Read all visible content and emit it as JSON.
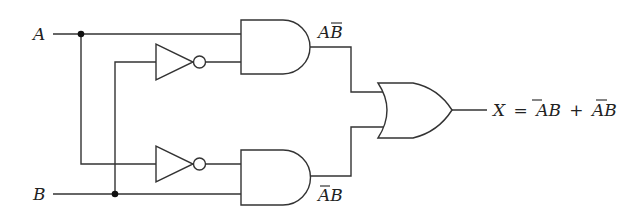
{
  "diagram": {
    "type": "logic-circuit",
    "inputs": {
      "a_label": "A",
      "b_label": "B"
    },
    "gates": [
      {
        "id": "not1",
        "kind": "NOT",
        "input": "B",
        "output": "B̄"
      },
      {
        "id": "not2",
        "kind": "NOT",
        "input": "A",
        "output": "Ā"
      },
      {
        "id": "and1",
        "kind": "AND",
        "inputs": [
          "A",
          "B̄"
        ],
        "output_label": "AB̄"
      },
      {
        "id": "and2",
        "kind": "AND",
        "inputs": [
          "Ā",
          "B"
        ],
        "output_label": "ĀB"
      },
      {
        "id": "or1",
        "kind": "OR",
        "inputs": [
          "AB̄",
          "ĀB"
        ],
        "output": "X"
      }
    ],
    "labels": {
      "and1_out_a": "A",
      "and1_out_b": "B",
      "and2_out_a": "A",
      "and2_out_b": "B",
      "output_x": "X",
      "equals": "=",
      "term1_a": "A",
      "term1_b": "B",
      "plus": "+",
      "term2_a": "A",
      "term2_b": "B"
    },
    "output_expression": "X = ĀB + AB̄",
    "colors": {
      "line": "#333333",
      "junction": "#111111",
      "text": "#222222",
      "background": "#ffffff"
    }
  }
}
